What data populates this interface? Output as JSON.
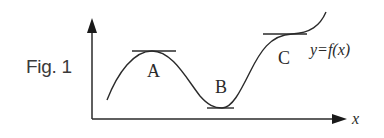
{
  "figure": {
    "label": "Fig. 1",
    "function_label": "y=f(x)",
    "x_axis_label": "x",
    "points": [
      {
        "id": "A",
        "label": "A",
        "kind": "local maximum (horizontal tangent)"
      },
      {
        "id": "B",
        "label": "B",
        "kind": "local minimum (horizontal tangent)"
      },
      {
        "id": "C",
        "label": "C",
        "kind": "horizontal inflection (horizontal tangent)"
      }
    ],
    "colors": {
      "stroke": "#2a2a2a",
      "background": "#ffffff",
      "text": "#3a3a3a"
    }
  }
}
